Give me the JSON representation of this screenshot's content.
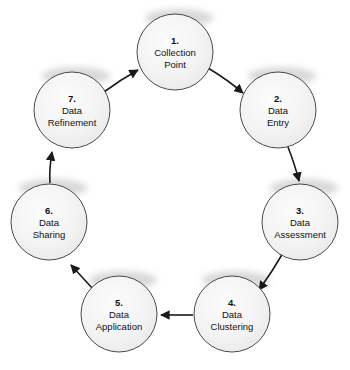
{
  "diagram": {
    "type": "circular-process-flow",
    "node_count": 7,
    "background_color": "#ffffff",
    "node_fill_color": "#f2f2f2",
    "node_stroke_color": "#4a4a4a",
    "arrow_color": "#1a1a1a",
    "text_color": "#111111",
    "nodes": [
      {
        "number": "1.",
        "line1": "Collection",
        "line2": "Point",
        "cx": 175,
        "cy": 52,
        "r": 38
      },
      {
        "number": "2.",
        "line1": "Data",
        "line2": "Entry",
        "cx": 278,
        "cy": 110,
        "r": 38
      },
      {
        "number": "3.",
        "line1": "Data",
        "line2": "Assessment",
        "cx": 300,
        "cy": 222,
        "r": 38
      },
      {
        "number": "4.",
        "line1": "Data",
        "line2": "Clustering",
        "cx": 232,
        "cy": 314,
        "r": 38
      },
      {
        "number": "5.",
        "line1": "Data",
        "line2": "Application",
        "cx": 119,
        "cy": 314,
        "r": 38
      },
      {
        "number": "6.",
        "line1": "Data",
        "line2": "Sharing",
        "cx": 49,
        "cy": 222,
        "r": 38
      },
      {
        "number": "7.",
        "line1": "Data",
        "line2": "Refinement",
        "cx": 72,
        "cy": 110,
        "r": 38
      }
    ],
    "connections": [
      {
        "from": "1.",
        "to": "2.",
        "shape": "curved"
      },
      {
        "from": "2.",
        "to": "3.",
        "shape": "curved"
      },
      {
        "from": "3.",
        "to": "4.",
        "shape": "curved"
      },
      {
        "from": "4.",
        "to": "5.",
        "shape": "straight"
      },
      {
        "from": "5.",
        "to": "6.",
        "shape": "straight"
      },
      {
        "from": "6.",
        "to": "7.",
        "shape": "curved"
      },
      {
        "from": "7.",
        "to": "1.",
        "shape": "curved"
      }
    ]
  }
}
